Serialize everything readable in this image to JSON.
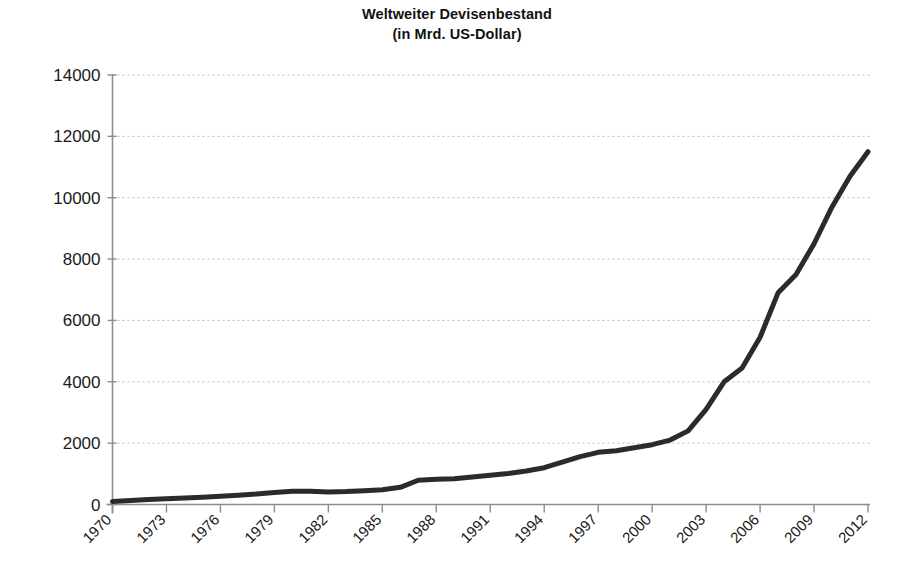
{
  "chart": {
    "title_line1": "Weltweiter Devisenbestand",
    "title_line2": "(in Mrd. US-Dollar)"
  },
  "chart_data": {
    "type": "line",
    "title": "Weltweiter Devisenbestand (in Mrd. US-Dollar)",
    "subtitle": "(in Mrd. US-Dollar)",
    "xlabel": "",
    "ylabel": "",
    "xlim": [
      1970,
      2012
    ],
    "ylim": [
      0,
      14000
    ],
    "ytick_values": [
      0,
      2000,
      4000,
      6000,
      8000,
      10000,
      12000,
      14000
    ],
    "ytick_labels": [
      "0",
      "2000",
      "4000",
      "6000",
      "8000",
      "10000",
      "12000",
      "14000"
    ],
    "xtick_values": [
      1970,
      1973,
      1976,
      1979,
      1982,
      1985,
      1988,
      1991,
      1994,
      1997,
      2000,
      2003,
      2006,
      2009,
      2012
    ],
    "xtick_labels": [
      "1970",
      "1973",
      "1976",
      "1979",
      "1982",
      "1985",
      "1988",
      "1991",
      "1994",
      "1997",
      "2000",
      "2003",
      "2006",
      "2009",
      "2012"
    ],
    "xtick_rotation_deg": 45,
    "minor_xticks_every_years": 1,
    "grid": {
      "horizontal": true,
      "vertical": false,
      "style": "dotted",
      "color": "#b9b9b9"
    },
    "legend": null,
    "line_color": "#2b2b2b",
    "line_width_px": 5,
    "x": [
      1970,
      1971,
      1972,
      1973,
      1974,
      1975,
      1976,
      1977,
      1978,
      1979,
      1980,
      1981,
      1982,
      1983,
      1984,
      1985,
      1986,
      1987,
      1988,
      1989,
      1990,
      1991,
      1992,
      1993,
      1994,
      1995,
      1996,
      1997,
      1998,
      1999,
      2000,
      2001,
      2002,
      2003,
      2004,
      2005,
      2006,
      2007,
      2008,
      2009,
      2010,
      2011,
      2012
    ],
    "values": [
      95,
      130,
      160,
      185,
      215,
      240,
      270,
      305,
      340,
      390,
      430,
      430,
      410,
      420,
      450,
      480,
      560,
      790,
      820,
      840,
      900,
      950,
      1010,
      1090,
      1200,
      1380,
      1560,
      1700,
      1750,
      1850,
      1950,
      2100,
      2400,
      3100,
      4000,
      4450,
      5450,
      6900,
      7500,
      8500,
      9700,
      10700,
      11500
    ]
  }
}
